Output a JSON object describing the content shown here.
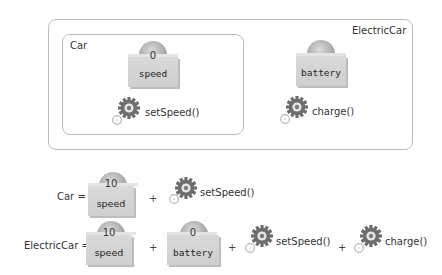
{
  "diagram": {
    "outer_class": {
      "name": "ElectricCar"
    },
    "inner_class": {
      "name": "Car"
    },
    "fields": [
      {
        "id": "speed",
        "label": "speed",
        "value": "0"
      },
      {
        "id": "battery",
        "label": "battery",
        "value": ""
      }
    ],
    "methods": [
      {
        "id": "setSpeed",
        "label": "setSpeed()",
        "icon": "gear-icon"
      },
      {
        "id": "charge",
        "label": "charge()",
        "icon": "gear-icon"
      }
    ]
  },
  "equations": {
    "car": {
      "lhs": "Car =",
      "terms": [
        {
          "type": "field",
          "label": "speed",
          "value": "10"
        },
        {
          "type": "op",
          "label": "+"
        },
        {
          "type": "method",
          "label": "setSpeed()"
        }
      ]
    },
    "electric_car": {
      "lhs": "ElectricCar =",
      "terms": [
        {
          "type": "field",
          "label": "speed",
          "value": "10"
        },
        {
          "type": "op",
          "label": "+"
        },
        {
          "type": "field",
          "label": "battery",
          "value": "0"
        },
        {
          "type": "op",
          "label": "+"
        },
        {
          "type": "method",
          "label": "setSpeed()"
        },
        {
          "type": "op",
          "label": "+"
        },
        {
          "type": "method",
          "label": "charge()"
        }
      ]
    }
  },
  "colors": {
    "frame": "#bdbdbd",
    "cube": "#d4d4d4",
    "sphere": "#a9a9a9",
    "gear": "#6e6e6e",
    "text": "#333333"
  }
}
